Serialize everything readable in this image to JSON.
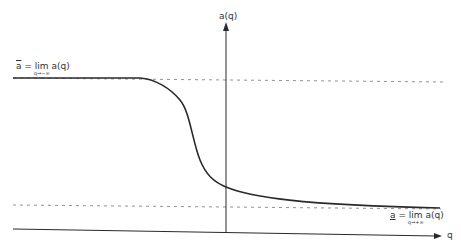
{
  "diagram": {
    "y_axis_label": "a(q)",
    "x_axis_label": "q",
    "upper_limit": {
      "symbol": "a",
      "decoration": "overline",
      "equals": "=",
      "operator": "lim",
      "subscript": "q→−∞",
      "function": "a(q)"
    },
    "lower_limit": {
      "symbol": "a",
      "decoration": "underline",
      "equals": "=",
      "operator": "lim",
      "subscript": "q→+∞",
      "function": "a(q)"
    },
    "curve_description": "decreasing sigmoid from upper asymptote to lower asymptote",
    "colors": {
      "line": "#2a2a2a",
      "dashed": "#777777",
      "background": "#ffffff"
    }
  }
}
